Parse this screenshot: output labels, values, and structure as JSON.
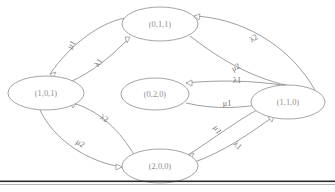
{
  "figure": {
    "type": "state-transition-diagram",
    "background_color": "#ffffff",
    "node_stroke_color": "#9a9a9a",
    "edge_stroke_color": "#8d8d8d",
    "label_color": "#8f8f8f",
    "rule_color": "#2b2b2b"
  },
  "nodes": [
    {
      "id": "n011",
      "label": "(0,1,1)",
      "cx": 160,
      "cy": 24,
      "rx": 38,
      "ry": 17
    },
    {
      "id": "n101",
      "label": "(1,0,1)",
      "cx": 46,
      "cy": 93,
      "rx": 38,
      "ry": 17
    },
    {
      "id": "n020",
      "label": "(0,2,0)",
      "cx": 155,
      "cy": 94,
      "rx": 34,
      "ry": 16
    },
    {
      "id": "n110",
      "label": "(1,1,0)",
      "cx": 288,
      "cy": 102,
      "rx": 37,
      "ry": 17
    },
    {
      "id": "n200",
      "label": "(2,0,0)",
      "cx": 160,
      "cy": 166,
      "rx": 38,
      "ry": 17
    }
  ],
  "edges": [
    {
      "id": "e1",
      "from": "(0,1,1)",
      "to": "(1,0,1)",
      "label": "μ1",
      "label_x": 72,
      "label_y": 45,
      "label_rotate": -58
    },
    {
      "id": "e2",
      "from": "(1,0,1)",
      "to": "(0,1,1)",
      "label": "λ1",
      "label_x": 99,
      "label_y": 63,
      "label_rotate": -55
    },
    {
      "id": "e3",
      "from": "(0,1,1)",
      "to": "(1,1,0)",
      "label": "λ2",
      "label_x": 254,
      "label_y": 39,
      "label_rotate": -33
    },
    {
      "id": "e4",
      "from": "(0,1,1)",
      "to": "(1,1,0)",
      "label": "μ2",
      "label_x": 236,
      "label_y": 68,
      "label_rotate": -28
    },
    {
      "id": "e5",
      "from": "(1,1,0)",
      "to": "(0,2,0)",
      "label": "λ1",
      "label_x": 237,
      "label_y": 81,
      "label_rotate": 0
    },
    {
      "id": "e6",
      "from": "(0,2,0)",
      "to": "(1,1,0)",
      "label": "μ1",
      "label_x": 227,
      "label_y": 104,
      "label_rotate": 0
    },
    {
      "id": "e7",
      "from": "(1,0,1)",
      "to": "(2,0,0)",
      "label": "λ2",
      "label_x": 104,
      "label_y": 119,
      "label_rotate": 24
    },
    {
      "id": "e8",
      "from": "(1,0,1)",
      "to": "(2,0,0)",
      "label": "μ2",
      "label_x": 80,
      "label_y": 144,
      "label_rotate": 35
    },
    {
      "id": "e9",
      "from": "(1,1,0)",
      "to": "(2,0,0)",
      "label": "μ1",
      "label_x": 217,
      "label_y": 130,
      "label_rotate": 55
    },
    {
      "id": "e10",
      "from": "(2,0,0)",
      "to": "(1,1,0)",
      "label": "λ1",
      "label_x": 237,
      "label_y": 146,
      "label_rotate": 43
    }
  ],
  "rule": {
    "present": true,
    "y": 181
  }
}
